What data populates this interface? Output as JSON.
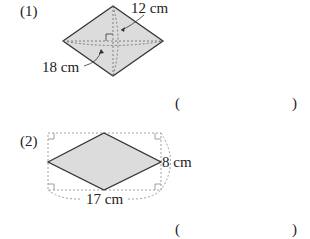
{
  "problems": [
    {
      "number": "(1)",
      "labels": {
        "diagonal_short": "12 cm",
        "diagonal_long": "18 cm"
      },
      "answer": {
        "open": "(",
        "close": ")"
      }
    },
    {
      "number": "(2)",
      "labels": {
        "height": "8 cm",
        "width": "17 cm"
      },
      "answer": {
        "open": "(",
        "close": ")"
      }
    }
  ],
  "colors": {
    "fill": "#d9d9d9",
    "stroke": "#333333",
    "dotted": "#777777"
  }
}
